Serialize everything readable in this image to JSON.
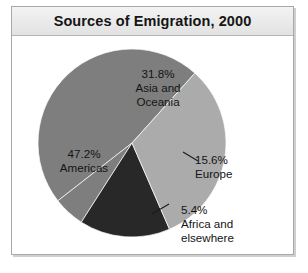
{
  "figure": {
    "title": "Sources of Emigration, 2000"
  },
  "chart_data": {
    "type": "pie",
    "title": "Sources of Emigration, 2000",
    "xlabel": "",
    "ylabel": "",
    "units": "percent",
    "legend_position": "none",
    "grid": false,
    "categories": [
      "Asia and Oceania",
      "Americas",
      "Europe",
      "Africa and elsewhere"
    ],
    "values": [
      31.8,
      47.2,
      15.6,
      5.4
    ],
    "colors": [
      "#ababab",
      "#7e7e7e",
      "#282828",
      "#7e7e7e"
    ],
    "slices": [
      {
        "name": "Asia and Oceania",
        "value": 31.8,
        "value_label": "31.8%",
        "color": "#ababab",
        "label_placement": "inside",
        "leader_line": false
      },
      {
        "name": "Americas",
        "value": 47.2,
        "value_label": "47.2%",
        "color": "#7e7e7e",
        "label_placement": "inside",
        "leader_line": false
      },
      {
        "name": "Europe",
        "value": 15.6,
        "value_label": "15.6%",
        "color": "#282828",
        "label_placement": "outside",
        "leader_line": true
      },
      {
        "name": "Africa and elsewhere",
        "value": 5.4,
        "value_label": "5.4%",
        "color": "#7e7e7e",
        "label_placement": "outside",
        "leader_line": true
      }
    ]
  },
  "labels": {
    "asia": {
      "percent": "31.8%",
      "line1": "Asia and",
      "line2": "Oceania"
    },
    "americas": {
      "percent": "47.2%",
      "line1": "Americas"
    },
    "europe": {
      "percent": "15.6%",
      "line1": "Europe"
    },
    "africa": {
      "percent": "5.4%",
      "line1": "Africa and",
      "line2": "elsewhere"
    }
  }
}
